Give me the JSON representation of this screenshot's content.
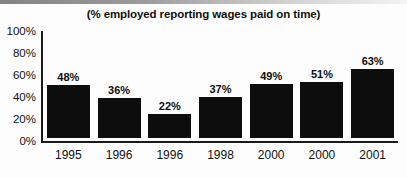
{
  "chart_data": {
    "type": "bar",
    "title": "(% employed reporting wages paid on time)",
    "xlabel": "",
    "ylabel": "",
    "categories": [
      "1995",
      "1996",
      "1996",
      "1998",
      "2000",
      "2000",
      "2001"
    ],
    "values": [
      48,
      36,
      22,
      37,
      49,
      51,
      63
    ],
    "value_labels": [
      "48%",
      "36%",
      "22%",
      "37%",
      "49%",
      "51%",
      "63%"
    ],
    "ylim": [
      0,
      100
    ],
    "ytick_labels": [
      "0%",
      "20%",
      "40%",
      "60%",
      "80%",
      "100%"
    ],
    "ytick_values": [
      0,
      20,
      40,
      60,
      80,
      100
    ],
    "grid": false,
    "legend": false,
    "bar_color": "#0d0d0d",
    "axis_color": "#1a1a1a",
    "background_color": "#fdfdfd"
  }
}
